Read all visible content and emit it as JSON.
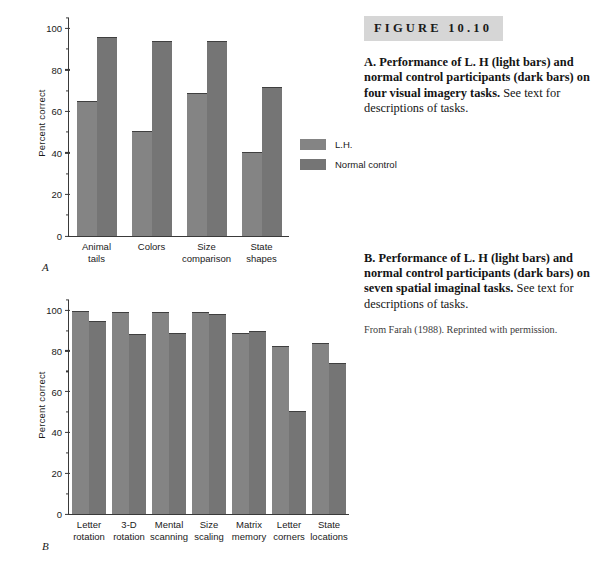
{
  "figure": {
    "banner_label": "FIGURE  10.10",
    "credit": "From Farah (1988). Reprinted with permission.",
    "caption_a_bold": "A. Performance of L. H (light bars) and normal control participants (dark bars) on four visual imagery tasks.",
    "caption_a_rest": " See text for descriptions of tasks.",
    "caption_b_bold": "B. Performance of L. H (light bars) and normal control participants (dark bars) on seven spatial imaginal tasks.",
    "caption_b_rest": " See text for descriptions of tasks."
  },
  "legend": {
    "items": [
      {
        "label": "L.H.",
        "color": "#848484"
      },
      {
        "label": "Normal control",
        "color": "#757575"
      }
    ]
  },
  "panel_a": {
    "letter": "A",
    "ylabel": "Percent correct",
    "yticks": [
      "0",
      "20",
      "40",
      "60",
      "80",
      "100"
    ]
  },
  "panel_b": {
    "letter": "B",
    "ylabel": "Percent correct",
    "yticks": [
      "0",
      "20",
      "40",
      "60",
      "80",
      "100"
    ]
  },
  "chart_data": [
    {
      "type": "bar",
      "title": "A. Performance on four visual imagery tasks",
      "xlabel": "",
      "ylabel": "Percent correct",
      "ylim": [
        0,
        105
      ],
      "yticks": [
        0,
        20,
        40,
        60,
        80,
        100
      ],
      "grid": false,
      "legend_position": "right",
      "categories": [
        "Animal tails",
        "Colors",
        "Size comparison",
        "State shapes"
      ],
      "category_lines": [
        [
          "Animal",
          "tails"
        ],
        [
          "Colors",
          ""
        ],
        [
          "Size",
          "comparison"
        ],
        [
          "State",
          "shapes"
        ]
      ],
      "series": [
        {
          "name": "L.H.",
          "color": "#848484",
          "values": [
            65,
            50.5,
            69,
            40.5
          ]
        },
        {
          "name": "Normal control",
          "color": "#757575",
          "values": [
            96,
            94,
            94,
            72
          ]
        }
      ]
    },
    {
      "type": "bar",
      "title": "B. Performance on seven spatial imaginal tasks",
      "xlabel": "",
      "ylabel": "Percent correct",
      "ylim": [
        0,
        105
      ],
      "yticks": [
        0,
        20,
        40,
        60,
        80,
        100
      ],
      "grid": false,
      "legend_position": "none",
      "categories": [
        "Letter rotation",
        "3-D rotation",
        "Mental scanning",
        "Size scaling",
        "Matrix memory",
        "Letter corners",
        "State locations"
      ],
      "category_lines": [
        [
          "Letter",
          "rotation"
        ],
        [
          "3-D",
          "rotation"
        ],
        [
          "Mental",
          "scanning"
        ],
        [
          "Size",
          "scaling"
        ],
        [
          "Matrix",
          "memory"
        ],
        [
          "Letter",
          "corners"
        ],
        [
          "State",
          "locations"
        ]
      ],
      "series": [
        {
          "name": "L.H.",
          "color": "#848484",
          "values": [
            99.5,
            99,
            99,
            99,
            89,
            82.5,
            84
          ]
        },
        {
          "name": "Normal control",
          "color": "#757575",
          "values": [
            94.5,
            88.5,
            89,
            98,
            90,
            50.5,
            74
          ]
        }
      ]
    }
  ]
}
